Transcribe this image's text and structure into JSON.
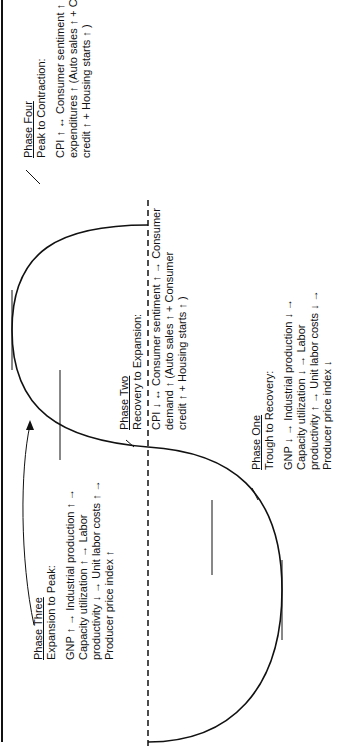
{
  "diagram": {
    "phases": [
      {
        "id": "phase-four",
        "title": "Phase Four",
        "subtitle": "Peak to Contraction:",
        "lines": [
          "CPI ↑ ↔ Consumer sentiment ↑ → Consumer",
          "expenditures ↑ (Auto sales ↑ + Consumer",
          "credit ↑ + Housing starts ↑ )"
        ]
      },
      {
        "id": "phase-two",
        "title": "Phase Two",
        "subtitle": "Recovery to Expansion:",
        "lines": [
          "CPI ↓ ↔ Consumer sentiment ↑ → Consumer",
          "demand ↑ (Auto sales ↑ + Consumer",
          "credit ↑ + Housing starts ↑ )"
        ]
      },
      {
        "id": "phase-three",
        "title": "Phase Three",
        "subtitle": "Expansion to Peak:",
        "lines": [
          "GNP ↑ → Industrial production ↑ →",
          "Capacity utilization ↑ → Labor",
          "productivity ↓ → Unit labor costs ↑ →",
          "Producer price index ↑"
        ]
      },
      {
        "id": "phase-one",
        "title": "Phase One",
        "subtitle": "Trough to Recovery:",
        "lines": [
          "GNP ↓ → Industrial production ↓ →",
          "Capacity utilization ↓ → Labor",
          "productivity ↑ → Unit labor costs ↓ →",
          "Producer price index ↓"
        ]
      }
    ]
  }
}
